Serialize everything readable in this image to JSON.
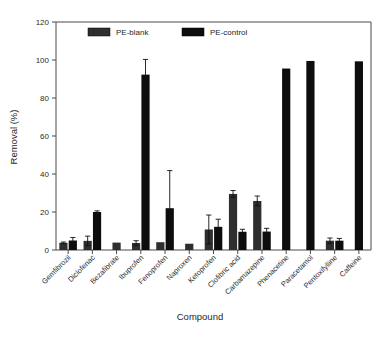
{
  "chart_data": {
    "type": "bar",
    "title": "",
    "xlabel": "Compound",
    "ylabel": "Removal (%)",
    "ylim": [
      0,
      120
    ],
    "yticks": [
      0,
      20,
      40,
      60,
      80,
      100,
      120
    ],
    "grid": false,
    "legend_position": "top-inside",
    "categories": [
      "Gemfibrozil",
      "Diclofenac",
      "Bezafibrate",
      "Ibuprofen",
      "Fenoprofen",
      "Naproxen",
      "Ketoprofen",
      "Clofibric acid",
      "Carbamazepine",
      "Phenacetine",
      "Paracetamol",
      "Pentoxifylline",
      "Caffeine"
    ],
    "series": [
      {
        "name": "PE-blank",
        "values": [
          3.8,
          4.8,
          3.9,
          3.7,
          4.1,
          3.3,
          10.8,
          29.5,
          25.8,
          null,
          null,
          4.9,
          null
        ],
        "errors": [
          0.4,
          2.5,
          0.0,
          1.2,
          0.0,
          0.0,
          7.6,
          1.8,
          2.6,
          null,
          null,
          1.4,
          null
        ]
      },
      {
        "name": "PE-control",
        "values": [
          5.0,
          20.0,
          null,
          92.3,
          22.0,
          null,
          12.2,
          9.6,
          9.7,
          95.5,
          99.5,
          4.9,
          99.3
        ],
        "errors": [
          1.6,
          0.6,
          null,
          8.0,
          19.8,
          null,
          4.0,
          1.3,
          1.7,
          0.0,
          0.0,
          1.2,
          0.0
        ]
      }
    ]
  },
  "legend": {
    "items": [
      {
        "label": "PE-blank",
        "swatch": "bar-swatch-hatched"
      },
      {
        "label": "PE-control",
        "swatch": "bar-swatch-solid"
      }
    ]
  },
  "colors": {
    "blank": "#2e2e2e",
    "control": "#0d0d0d",
    "axis": "#4a4a4a",
    "background": "#ffffff"
  }
}
